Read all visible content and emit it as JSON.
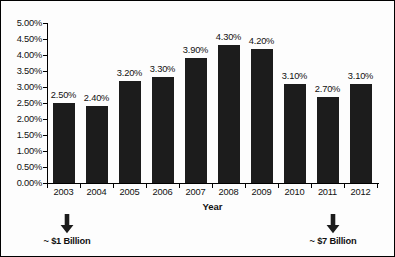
{
  "chart_data": {
    "type": "bar",
    "title": "",
    "xlabel": "Year",
    "ylabel": "",
    "categories": [
      "2003",
      "2004",
      "2005",
      "2006",
      "2007",
      "2008",
      "2009",
      "2010",
      "2011",
      "2012"
    ],
    "values": [
      2.5,
      2.4,
      3.2,
      3.3,
      3.9,
      4.3,
      4.2,
      3.1,
      2.7,
      3.1
    ],
    "value_labels": [
      "2.50%",
      "2.40%",
      "3.20%",
      "3.30%",
      "3.90%",
      "4.30%",
      "4.20%",
      "3.10%",
      "2.70%",
      "3.10%"
    ],
    "ylim": [
      0,
      5
    ],
    "ytick_values": [
      0,
      0.5,
      1,
      1.5,
      2,
      2.5,
      3,
      3.5,
      4,
      4.5,
      5
    ],
    "ytick_labels": [
      "0.00%",
      "0.50%",
      "1.00%",
      "1.50%",
      "2.00%",
      "2.50%",
      "3.00%",
      "3.50%",
      "4.00%",
      "4.50%",
      "5.00%"
    ],
    "grid": false,
    "legend": false,
    "bar_color": "#1c1c1c",
    "annotations": [
      {
        "text": "~ $1 Billion",
        "anchor_category": "2003",
        "icon": "down-arrow-icon"
      },
      {
        "text": "~ $7 Billion",
        "anchor_category": "2012",
        "icon": "down-arrow-icon"
      }
    ]
  },
  "axis": {
    "x_title": "Year"
  }
}
